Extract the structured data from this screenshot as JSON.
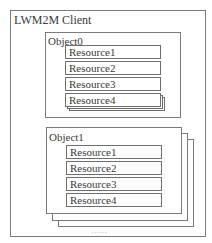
{
  "diagram": {
    "client": {
      "title": "LWM2M Client"
    },
    "objects": [
      {
        "title": "Object0",
        "resources": [
          "Resource1",
          "Resource2",
          "Resource3",
          "Resource4"
        ]
      },
      {
        "title": "Object1",
        "resources": [
          "Resource1",
          "Resource2",
          "Resource3",
          "Resource4"
        ]
      }
    ],
    "ellipsis": "……",
    "colors": {
      "border": "#7a7a7a",
      "text": "#3a3a3a",
      "background": "#ffffff"
    }
  }
}
